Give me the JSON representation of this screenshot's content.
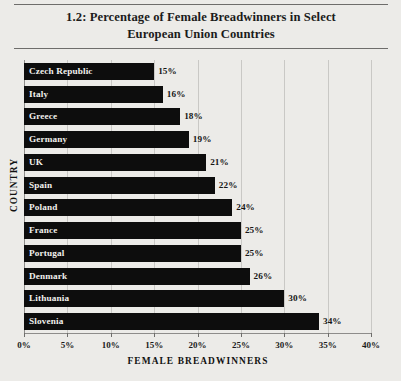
{
  "chart_data": {
    "type": "bar",
    "orientation": "horizontal",
    "title": "1.2: Percentage of Female Breadwinners in Select European Union Countries",
    "title_line1": "1.2: Percentage of Female Breadwinners in Select",
    "title_line2": "European Union Countries",
    "xlabel": "FEMALE BREADWINNERS",
    "ylabel": "COUNTRY",
    "categories": [
      "Czech Republic",
      "Italy",
      "Greece",
      "Germany",
      "UK",
      "Spain",
      "Poland",
      "France",
      "Portugal",
      "Denmark",
      "Lithuania",
      "Slovenia"
    ],
    "values": [
      15,
      16,
      18,
      19,
      21,
      22,
      24,
      25,
      25,
      26,
      30,
      34
    ],
    "value_labels": [
      "15%",
      "16%",
      "18%",
      "19%",
      "21%",
      "22%",
      "24%",
      "25%",
      "25%",
      "26%",
      "30%",
      "34%"
    ],
    "xlim": [
      0,
      40
    ],
    "xticks": [
      0,
      5,
      10,
      15,
      20,
      25,
      30,
      35,
      40
    ],
    "xtick_labels": [
      "0%",
      "5%",
      "10%",
      "15%",
      "20%",
      "25%",
      "30%",
      "35%",
      "40%"
    ],
    "grid": true,
    "grid_axis": "x",
    "legend": false,
    "bar_color": "#0d0d0d",
    "bar_label_color": "#f2f1ee",
    "background_color": "#ecebe8",
    "grid_color": "#c9c8c5",
    "axis_color": "#8d8c8a"
  }
}
